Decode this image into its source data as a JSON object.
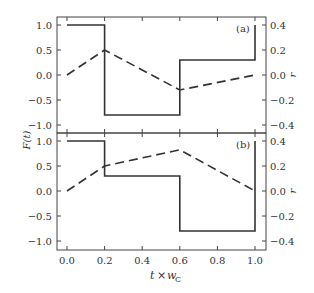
{
  "chart_data": [
    {
      "panel": "(a)",
      "type": "line",
      "x_ticks": [
        0.0,
        0.2,
        0.4,
        0.6,
        0.8,
        1.0
      ],
      "x_tick_labels": [
        "0.0",
        "0.2",
        "0.4",
        "0.6",
        "0.8",
        "1.0"
      ],
      "ylabel_left": "F(t)",
      "ylabel_right": "r",
      "ylim_left": [
        -1.15,
        1.15
      ],
      "ylim_right": [
        -0.46,
        0.46
      ],
      "y_ticks_left": [
        "1.0",
        "0.5",
        "0.0",
        "−0.5",
        "−1.0"
      ],
      "y_ticks_right": [
        "0.4",
        "0.2",
        "0.0",
        "−0.2",
        "−0.4"
      ],
      "series": [
        {
          "name": "F(t)",
          "style": "solid",
          "axis": "left",
          "x": [
            0.0,
            0.2,
            0.2,
            0.6,
            0.6,
            1.0,
            1.0
          ],
          "y": [
            1.0,
            1.0,
            -0.8,
            -0.8,
            0.3,
            0.3,
            1.0
          ]
        },
        {
          "name": "r",
          "style": "dashed",
          "axis": "right",
          "x": [
            0.0,
            0.2,
            0.6,
            1.0
          ],
          "y": [
            0.0,
            0.2,
            -0.12,
            0.0
          ]
        }
      ]
    },
    {
      "panel": "(b)",
      "type": "line",
      "x_ticks": [
        0.0,
        0.2,
        0.4,
        0.6,
        0.8,
        1.0
      ],
      "x_tick_labels": [
        "0.0",
        "0.2",
        "0.4",
        "0.6",
        "0.8",
        "1.0"
      ],
      "xlabel": "t × w_C",
      "ylabel_left": "F(t)",
      "ylabel_right": "r",
      "ylim_left": [
        -1.15,
        1.15
      ],
      "ylim_right": [
        -0.46,
        0.46
      ],
      "y_ticks_left": [
        "1.0",
        "0.5",
        "0.0",
        "−0.5",
        "−1.0"
      ],
      "y_ticks_right": [
        "0.4",
        "0.2",
        "0.0",
        "−0.2",
        "−0.4"
      ],
      "series": [
        {
          "name": "F(t)",
          "style": "solid",
          "axis": "left",
          "x": [
            0.0,
            0.2,
            0.2,
            0.6,
            0.6,
            1.0,
            1.0
          ],
          "y": [
            1.0,
            1.0,
            0.3,
            0.3,
            -0.8,
            -0.8,
            1.0
          ]
        },
        {
          "name": "r",
          "style": "dashed",
          "axis": "right",
          "x": [
            0.0,
            0.2,
            0.6,
            1.0
          ],
          "y": [
            0.0,
            0.2,
            0.33,
            0.0
          ]
        }
      ]
    }
  ],
  "labels": {
    "panel_a": "(a)",
    "panel_b": "(b)",
    "ylabel_left": "F(t)",
    "ylabel_right": "r",
    "xlabel_t": "t",
    "xlabel_times": "×",
    "xlabel_w": "w",
    "xlabel_sub": "C"
  }
}
